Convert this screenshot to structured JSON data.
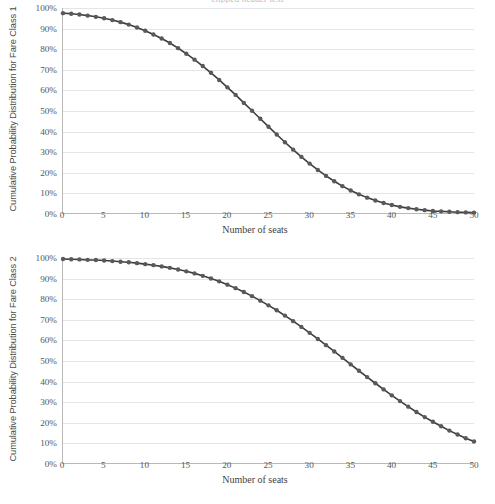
{
  "page": {
    "cut_off_header": "clipped header text"
  },
  "chart_data": [
    {
      "type": "line",
      "id": "fare-class-1",
      "title": "",
      "xlabel": "Number of seats",
      "ylabel": "Cumulative Probability Distribution for Fare Class 1",
      "xlim": [
        0,
        50
      ],
      "ylim": [
        0,
        1
      ],
      "grid": true,
      "legend": "none",
      "marker": "circle",
      "series_color": "#595959",
      "xticks": [
        0,
        5,
        10,
        15,
        20,
        25,
        30,
        35,
        40,
        45,
        50
      ],
      "xtick_labels": [
        "0",
        "5",
        "10",
        "15",
        "20",
        "25",
        "30",
        "35",
        "40",
        "45",
        "50"
      ],
      "yticks": [
        0,
        0.1,
        0.2,
        0.3,
        0.4,
        0.5,
        0.6,
        0.7,
        0.8,
        0.9,
        1.0
      ],
      "ytick_labels": [
        "0%",
        "10%",
        "20%",
        "30%",
        "40%",
        "50%",
        "60%",
        "70%",
        "80%",
        "90%",
        "100%"
      ],
      "x": [
        0,
        1,
        2,
        3,
        4,
        5,
        6,
        7,
        8,
        9,
        10,
        11,
        12,
        13,
        14,
        15,
        16,
        17,
        18,
        19,
        20,
        21,
        22,
        23,
        24,
        25,
        26,
        27,
        28,
        29,
        30,
        31,
        32,
        33,
        34,
        35,
        36,
        37,
        38,
        39,
        40,
        41,
        42,
        43,
        44,
        45,
        46,
        47,
        48,
        49,
        50
      ],
      "values": [
        0.975,
        0.972,
        0.968,
        0.963,
        0.957,
        0.95,
        0.941,
        0.931,
        0.919,
        0.905,
        0.889,
        0.871,
        0.851,
        0.829,
        0.804,
        0.777,
        0.748,
        0.717,
        0.684,
        0.649,
        0.613,
        0.576,
        0.537,
        0.499,
        0.46,
        0.421,
        0.383,
        0.345,
        0.309,
        0.274,
        0.241,
        0.21,
        0.181,
        0.155,
        0.131,
        0.11,
        0.091,
        0.075,
        0.061,
        0.049,
        0.039,
        0.03,
        0.024,
        0.018,
        0.014,
        0.01,
        0.008,
        0.006,
        0.004,
        0.003,
        0.002
      ]
    },
    {
      "type": "line",
      "id": "fare-class-2",
      "title": "",
      "xlabel": "Number of seats",
      "ylabel": "Cumulative Probability Distribution for Fare Class 2",
      "xlim": [
        0,
        50
      ],
      "ylim": [
        0,
        1
      ],
      "grid": true,
      "legend": "none",
      "marker": "circle",
      "series_color": "#595959",
      "xticks": [
        0,
        5,
        10,
        15,
        20,
        25,
        30,
        35,
        40,
        45,
        50
      ],
      "xtick_labels": [
        "0",
        "5",
        "10",
        "15",
        "20",
        "25",
        "30",
        "35",
        "40",
        "45",
        "50"
      ],
      "yticks": [
        0,
        0.1,
        0.2,
        0.3,
        0.4,
        0.5,
        0.6,
        0.7,
        0.8,
        0.9,
        1.0
      ],
      "ytick_labels": [
        "0%",
        "10%",
        "20%",
        "30%",
        "40%",
        "50%",
        "60%",
        "70%",
        "80%",
        "90%",
        "100%"
      ],
      "x": [
        0,
        1,
        2,
        3,
        4,
        5,
        6,
        7,
        8,
        9,
        10,
        11,
        12,
        13,
        14,
        15,
        16,
        17,
        18,
        19,
        20,
        21,
        22,
        23,
        24,
        25,
        26,
        27,
        28,
        29,
        30,
        31,
        32,
        33,
        34,
        35,
        36,
        37,
        38,
        39,
        40,
        41,
        42,
        43,
        44,
        45,
        46,
        47,
        48,
        49,
        50
      ],
      "values": [
        0.995,
        0.994,
        0.993,
        0.991,
        0.99,
        0.988,
        0.985,
        0.982,
        0.979,
        0.975,
        0.97,
        0.965,
        0.959,
        0.952,
        0.944,
        0.935,
        0.925,
        0.913,
        0.9,
        0.886,
        0.87,
        0.853,
        0.834,
        0.814,
        0.792,
        0.769,
        0.745,
        0.719,
        0.692,
        0.664,
        0.635,
        0.605,
        0.575,
        0.544,
        0.513,
        0.481,
        0.45,
        0.419,
        0.389,
        0.359,
        0.33,
        0.302,
        0.275,
        0.249,
        0.224,
        0.201,
        0.179,
        0.158,
        0.139,
        0.121,
        0.105
      ]
    }
  ],
  "charts": [
    {
      "y_axis_title": "Cumulative Probability Distribution for Fare Class 1",
      "x_axis_title": "Number of seats"
    },
    {
      "y_axis_title": "Cumulative Probability Distribution for Fare Class 2",
      "x_axis_title": "Number of seats"
    }
  ]
}
